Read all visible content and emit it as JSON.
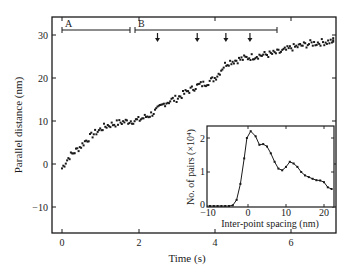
{
  "chart_data": [
    {
      "type": "scatter",
      "title": "",
      "xlabel": "Time (s)",
      "ylabel": "Parallel distance (nm)",
      "xlim": [
        -0.25,
        7.2
      ],
      "ylim": [
        -16.5,
        33.5
      ],
      "xticks": [
        0,
        2,
        4,
        6
      ],
      "yticks": [
        -10,
        0,
        10,
        20,
        30
      ],
      "grid": false,
      "series": [
        {
          "name": "trace",
          "x": [
            0.0,
            0.1,
            0.2,
            0.3,
            0.4,
            0.5,
            0.6,
            0.7,
            0.8,
            0.9,
            1.0,
            1.1,
            1.2,
            1.3,
            1.4,
            1.5,
            1.6,
            1.7,
            1.8,
            1.9,
            2.0,
            2.1,
            2.2,
            2.3,
            2.4,
            2.5,
            2.6,
            2.7,
            2.8,
            2.9,
            3.0,
            3.1,
            3.2,
            3.3,
            3.4,
            3.5,
            3.6,
            3.7,
            3.8,
            3.9,
            4.0,
            4.1,
            4.2,
            4.3,
            4.4,
            4.5,
            4.6,
            4.7,
            4.8,
            4.9,
            5.0,
            5.1,
            5.2,
            5.3,
            5.4,
            5.5,
            5.6,
            5.7,
            5.8,
            5.9,
            6.0,
            6.1,
            6.2,
            6.3,
            6.4,
            6.5,
            6.6,
            6.7,
            6.8,
            6.9,
            7.0,
            7.1
          ],
          "y": [
            -1.0,
            0.5,
            1.8,
            2.6,
            3.4,
            4.2,
            5.2,
            6.0,
            6.8,
            7.4,
            8.0,
            8.6,
            9.0,
            9.2,
            9.4,
            9.6,
            9.8,
            9.9,
            10.0,
            10.1,
            10.2,
            10.6,
            11.0,
            11.4,
            12.0,
            12.6,
            13.4,
            14.2,
            14.6,
            15.0,
            15.2,
            15.8,
            16.4,
            17.0,
            17.4,
            18.0,
            18.4,
            18.6,
            19.0,
            19.4,
            20.0,
            21.0,
            22.4,
            23.4,
            23.8,
            24.0,
            24.2,
            24.4,
            24.6,
            24.8,
            25.0,
            25.2,
            25.3,
            25.4,
            25.5,
            25.6,
            25.8,
            26.0,
            26.3,
            26.6,
            27.0,
            27.2,
            27.4,
            27.6,
            27.8,
            28.0,
            28.1,
            28.2,
            28.3,
            28.4,
            28.5,
            28.6
          ]
        }
      ],
      "annotations": {
        "segment_A": {
          "label": "A",
          "t_start": 0.0,
          "t_end": 1.78,
          "y": 31
        },
        "segment_B": {
          "label": "B",
          "t_start": 1.9,
          "t_end": 5.6,
          "y": 31
        },
        "arrows_t": [
          2.5,
          3.54,
          4.29,
          4.92
        ]
      }
    },
    {
      "type": "line",
      "title": "",
      "inset": true,
      "xlabel": "Inter-point spacing (nm)",
      "ylabel": "No. of pairs (×10⁴)",
      "xlim": [
        -10,
        22.5
      ],
      "ylim": [
        0,
        2.35
      ],
      "xticks": [
        -10,
        0,
        10,
        20
      ],
      "yticks": [
        0,
        1,
        2
      ],
      "grid": false,
      "series": [
        {
          "name": "pair histogram",
          "x": [
            -10,
            -9,
            -8,
            -7,
            -6,
            -5,
            -4,
            -3,
            -2,
            -1,
            -0.3,
            0.7,
            2,
            3,
            4,
            5,
            6,
            7,
            8,
            9,
            10,
            11,
            12,
            13,
            14,
            15,
            16,
            17,
            18,
            19,
            20,
            21,
            22
          ],
          "y": [
            0,
            0,
            0,
            0,
            0,
            0,
            0.02,
            0.18,
            0.65,
            1.4,
            2.0,
            2.2,
            2.05,
            1.8,
            1.82,
            1.75,
            1.55,
            1.3,
            1.1,
            1.05,
            1.15,
            1.3,
            1.25,
            1.15,
            1.0,
            0.9,
            0.85,
            0.8,
            0.76,
            0.75,
            0.7,
            0.55,
            0.5
          ]
        }
      ]
    }
  ],
  "main": {
    "xlabel": "Time (s)",
    "ylabel": "Parallel distance (nm)",
    "xtick_labels": [
      "0",
      "2",
      "4",
      "6"
    ],
    "ytick_labels": [
      "30",
      "20",
      "10",
      "0",
      "−10"
    ],
    "segment_labels": [
      "A",
      "B"
    ]
  },
  "inset": {
    "xlabel": "Inter-point spacing (nm)",
    "ylabel": "No. of pairs (×10⁴)",
    "xtick_labels": [
      "−10",
      "0",
      "10",
      "20"
    ],
    "ytick_labels": [
      "2",
      "1",
      "0"
    ]
  }
}
